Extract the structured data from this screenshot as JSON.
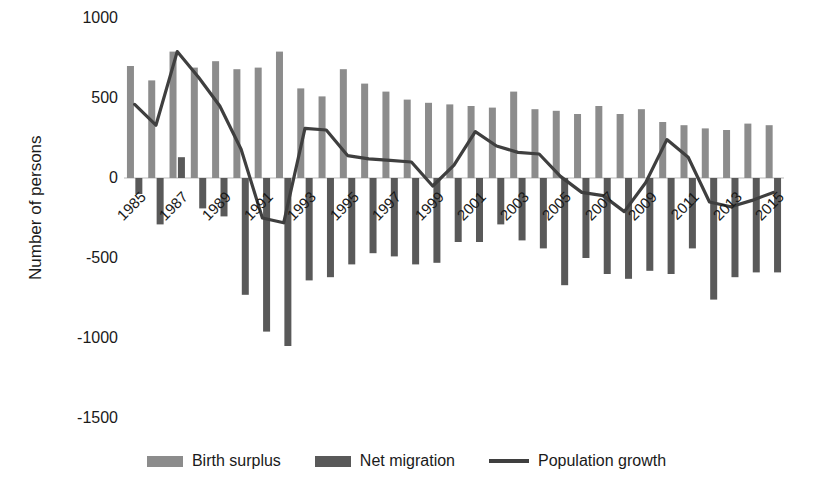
{
  "chart_data": {
    "type": "bar",
    "title": "",
    "xlabel": "",
    "ylabel": "Number of persons",
    "ylim": [
      -1500,
      1000
    ],
    "yticks": [
      1000,
      500,
      0,
      -500,
      -1000,
      -1500
    ],
    "ytick_labels": [
      "1000",
      "500",
      "0",
      "-500",
      "-1000",
      "-1500"
    ],
    "grid": false,
    "legend_position": "bottom",
    "categories": [
      "1985",
      "1986",
      "1987",
      "1988",
      "1989",
      "1990",
      "1991",
      "1992",
      "1993",
      "1994",
      "1995",
      "1996",
      "1997",
      "1998",
      "1999",
      "2000",
      "2001",
      "2002",
      "2003",
      "2004",
      "2005",
      "2006",
      "2007",
      "2008",
      "2009",
      "2010",
      "2011",
      "2012",
      "2013",
      "2014",
      "2015"
    ],
    "xtick_labels": [
      "1985",
      "1987",
      "1989",
      "1991",
      "1993",
      "1995",
      "1997",
      "1999",
      "2001",
      "2003",
      "2005",
      "2007",
      "2009",
      "2011",
      "2013",
      "2015"
    ],
    "series": [
      {
        "name": "Birth surplus",
        "type": "bar",
        "color": "#8c8c8c",
        "values": [
          700,
          610,
          790,
          690,
          730,
          680,
          690,
          790,
          560,
          510,
          680,
          590,
          540,
          490,
          470,
          460,
          450,
          440,
          540,
          430,
          420,
          400,
          450,
          400,
          430,
          350,
          330,
          310,
          300,
          340,
          330
        ]
      },
      {
        "name": "Net migration",
        "type": "bar",
        "color": "#595959",
        "values": [
          -100,
          -290,
          130,
          -190,
          -240,
          -730,
          -960,
          -1050,
          -640,
          -620,
          -540,
          -470,
          -490,
          -540,
          -530,
          -400,
          -400,
          -290,
          -390,
          -440,
          -670,
          -500,
          -600,
          -630,
          -580,
          -600,
          -440,
          -760,
          -620,
          -590,
          -590
        ]
      },
      {
        "name": "Population growth",
        "type": "line",
        "color": "#3f3f3f",
        "values": [
          460,
          330,
          790,
          630,
          450,
          180,
          -250,
          -280,
          310,
          300,
          140,
          120,
          110,
          100,
          -50,
          80,
          290,
          200,
          160,
          150,
          10,
          -90,
          -110,
          -210,
          -30,
          240,
          130,
          -150,
          -180,
          -140,
          -90
        ]
      }
    ],
    "legend": [
      {
        "label": "Birth surplus",
        "marker": "bar",
        "color": "#8c8c8c"
      },
      {
        "label": "Net migration",
        "marker": "bar",
        "color": "#595959"
      },
      {
        "label": "Population growth",
        "marker": "line",
        "color": "#3f3f3f"
      }
    ]
  }
}
